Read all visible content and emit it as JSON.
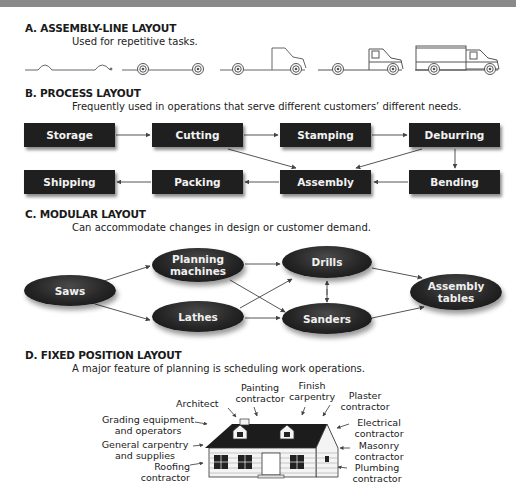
{
  "sections": {
    "a": {
      "title": "A. ASSEMBLY-LINE LAYOUT",
      "description": "Used for repetitive tasks."
    },
    "b": {
      "title": "B. PROCESS LAYOUT",
      "description": "Frequently used in operations that serve different customers’ different needs."
    },
    "c": {
      "title": "C.  MODULAR LAYOUT",
      "description": "Can accommodate changes in design or customer demand."
    },
    "d": {
      "title": "D. FIXED POSITION LAYOUT",
      "description": "A major feature of planning is scheduling work operations."
    }
  },
  "assembly_line": {
    "stages": [
      "frame",
      "frame-with-wheels",
      "cab-shell",
      "cab-complete",
      "full-van"
    ]
  },
  "process_layout": {
    "row1": [
      "Storage",
      "Cutting",
      "Stamping",
      "Deburring"
    ],
    "row2": [
      "Shipping",
      "Packing",
      "Assembly",
      "Bending"
    ]
  },
  "modular_layout": {
    "nodes": {
      "saws": "Saws",
      "planning_1": "Planning",
      "planning_2": "machines",
      "lathes": "Lathes",
      "drills": "Drills",
      "sanders": "Sanders",
      "assembly_1": "Assembly",
      "assembly_2": "tables"
    }
  },
  "fixed_position": {
    "labels": {
      "architect": "Architect",
      "painting_1": "Painting",
      "painting_2": "contractor",
      "finish_1": "Finish",
      "finish_2": "carpentry",
      "plaster_1": "Plaster",
      "plaster_2": "contractor",
      "grading_1": "Grading equipment",
      "grading_2": "and operators",
      "general_1": "General carpentry",
      "general_2": "and supplies",
      "roofing_1": "Roofing",
      "roofing_2": "contractor",
      "electrical_1": "Electrical",
      "electrical_2": "contractor",
      "masonry_1": "Masonry",
      "masonry_2": "contractor",
      "plumbing_1": "Plumbing",
      "plumbing_2": "contractor"
    }
  }
}
